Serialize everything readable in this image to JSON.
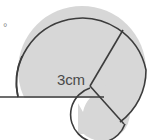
{
  "figure": {
    "background_color": "#ffffff",
    "fill_color": "#d7d7d7",
    "stroke_color": "#3c3c3c",
    "label_color": "#4a4a4a",
    "width": 155,
    "height": 140
  },
  "labels": {
    "radius_label": "3cm",
    "degree_symbol": "°"
  },
  "chart_data": {
    "type": "diagram",
    "title": "",
    "shapes": [
      {
        "name": "large-circle",
        "kind": "circle",
        "center": [
          82,
          70
        ],
        "radius": 64,
        "fill": "#d7d7d7",
        "stroke": "#3c3c3c"
      },
      {
        "name": "small-circle",
        "kind": "circle",
        "center": [
          102,
          113
        ],
        "radius": 28,
        "fill": "#d7d7d7",
        "stroke": "#3c3c3c"
      },
      {
        "name": "horizontal-diameter",
        "kind": "line",
        "from": [
          0,
          97
        ],
        "to": [
          104,
          97
        ],
        "stroke": "#3c3c3c"
      },
      {
        "name": "radius-chord-upper",
        "kind": "line",
        "from": [
          90,
          86
        ],
        "to": [
          123,
          30
        ],
        "stroke": "#3c3c3c"
      },
      {
        "name": "radius-chord-lower",
        "kind": "line",
        "from": [
          90,
          86
        ],
        "to": [
          124,
          124
        ],
        "stroke": "#3c3c3c"
      }
    ],
    "annotations": [
      {
        "text": "3cm",
        "x": 57,
        "y": 80
      },
      {
        "text": "°",
        "x": 6,
        "y": 29
      }
    ]
  }
}
